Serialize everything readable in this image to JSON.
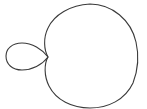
{
  "figure": {
    "description": "Limaçon-shaped closed curve with a small inner loop on the left and a large lobe on the right",
    "stroke_color": "#3a3a3a",
    "background_color": "#ffffff",
    "shape": "limacon-with-inner-loop",
    "crossing_point": [
      48,
      57
    ],
    "outer_lobe": {
      "left": 44,
      "right": 137,
      "top": 4,
      "bottom": 108
    },
    "inner_loop": {
      "left": 6,
      "right": 48,
      "top": 43,
      "bottom": 70
    }
  }
}
